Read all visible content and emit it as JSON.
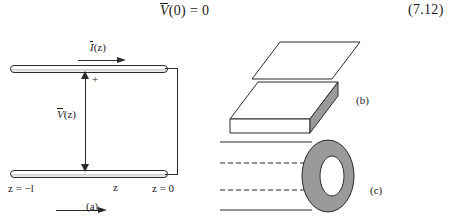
{
  "equation": {
    "lhs_var": "V",
    "lhs_arg": "(0)",
    "relation": "=",
    "rhs": "0",
    "number": "(7.12)"
  },
  "figure_a": {
    "name": "two-wire-transmission-line",
    "current_label_var": "I",
    "current_label_arg": "(z)",
    "voltage_label_var": "V",
    "voltage_label_arg": "(z)",
    "polarity_marker": "+",
    "left_end_label": "z = −l",
    "axis_label": "z",
    "right_end_label": "z = 0",
    "caption": "(a)"
  },
  "figure_b": {
    "name": "parallel-plate-line",
    "caption": "(b)"
  },
  "figure_c": {
    "name": "coaxial-line",
    "caption": "(c)"
  },
  "colors": {
    "ink": "#1a1a1a",
    "line": "#2b2b2b",
    "shade_fill": "#9a9a9a",
    "plate_fill": "#ffffff",
    "page_background": "#ffffff"
  }
}
